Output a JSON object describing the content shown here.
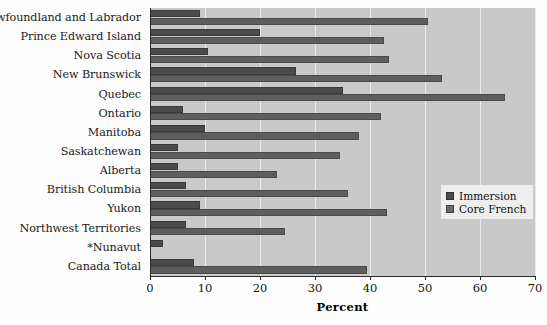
{
  "chart_data": {
    "type": "bar",
    "orientation": "horizontal",
    "title": "",
    "xlabel": "Percent",
    "ylabel": "",
    "xlim": [
      0,
      70
    ],
    "xticks": [
      0,
      10,
      20,
      30,
      40,
      50,
      60,
      70
    ],
    "grid": true,
    "legend_position": "right-middle",
    "categories": [
      "Newfoundland and Labrador",
      "Prince Edward Island",
      "Nova Scotia",
      "New Brunswick",
      "Quebec",
      "Ontario",
      "Manitoba",
      "Saskatchewan",
      "Alberta",
      "British Columbia",
      "Yukon",
      "Northwest Territories",
      "*Nunavut",
      "Canada Total"
    ],
    "series": [
      {
        "name": "Immersion",
        "color": "#4b4b4b",
        "values": [
          9,
          20,
          10.5,
          26.5,
          35,
          6,
          10,
          5,
          5,
          6.5,
          9,
          6.5,
          2.3,
          8
        ]
      },
      {
        "name": "Core French",
        "color": "#5e5e5e",
        "values": [
          50.5,
          42.5,
          43.5,
          53,
          64.5,
          42,
          38,
          34.5,
          23,
          36,
          43,
          24.5,
          0,
          39.5
        ]
      }
    ]
  },
  "legend": {
    "items": [
      {
        "label": "Immersion",
        "swatch": "immersion-swatch"
      },
      {
        "label": "Core French",
        "swatch": "core-french-swatch"
      }
    ]
  }
}
